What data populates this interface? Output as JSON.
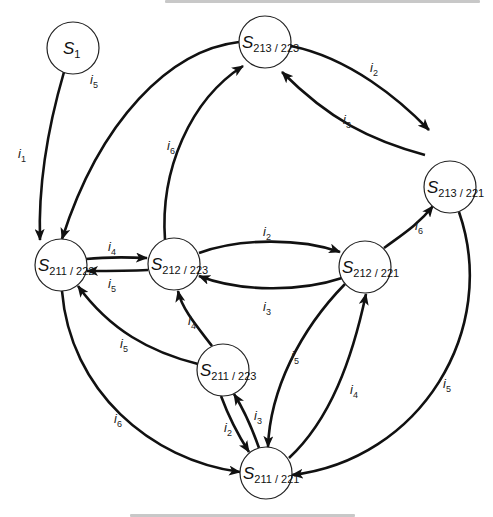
{
  "figure": {
    "type": "state-transition-diagram",
    "top_caption_fragment": "",
    "bottom_caption_fragment": ""
  },
  "nodes": [
    {
      "id": "S1",
      "symbol": "S",
      "sub": "1",
      "x": 73,
      "y": 48,
      "r": 26
    },
    {
      "id": "S213_223",
      "symbol": "S",
      "sub": "213 / 223",
      "x": 265,
      "y": 42,
      "r": 26
    },
    {
      "id": "S213_221",
      "symbol": "S",
      "sub": "213 / 221",
      "x": 450,
      "y": 187,
      "r": 26
    },
    {
      "id": "S211_222",
      "symbol": "S",
      "sub": "211 / 222",
      "x": 61,
      "y": 265,
      "r": 26
    },
    {
      "id": "S212_223",
      "symbol": "S",
      "sub": "212 / 223",
      "x": 174,
      "y": 264,
      "r": 26
    },
    {
      "id": "S212_221",
      "symbol": "S",
      "sub": "212 / 221",
      "x": 365,
      "y": 267,
      "r": 26
    },
    {
      "id": "S211_223",
      "symbol": "S",
      "sub": "211 / 223",
      "x": 223,
      "y": 370,
      "r": 26
    },
    {
      "id": "S211_221",
      "symbol": "S",
      "sub": "211 / 221",
      "x": 266,
      "y": 473,
      "r": 26
    }
  ],
  "edges": [
    {
      "from": "S1",
      "to": "S211_222",
      "symbol": "i",
      "sub": "1",
      "lx": 18,
      "ly": 158
    },
    {
      "from": "S213_223",
      "to": "S211_222",
      "symbol": "i",
      "sub": "5",
      "lx": 90,
      "ly": 84
    },
    {
      "from": "S213_223",
      "to": "S213_221",
      "symbol": "i",
      "sub": "2",
      "lx": 370,
      "ly": 72
    },
    {
      "from": "S213_221",
      "to": "S213_223",
      "symbol": "i",
      "sub": "3",
      "lx": 343,
      "ly": 124
    },
    {
      "from": "S212_223",
      "to": "S213_223",
      "symbol": "i",
      "sub": "6",
      "lx": 167,
      "ly": 150
    },
    {
      "from": "S211_222",
      "to": "S212_223",
      "symbol": "i",
      "sub": "4",
      "lx": 108,
      "ly": 251
    },
    {
      "from": "S212_223",
      "to": "S211_222",
      "symbol": "i",
      "sub": "5",
      "lx": 108,
      "ly": 288
    },
    {
      "from": "S212_223",
      "to": "S212_221",
      "symbol": "i",
      "sub": "2",
      "lx": 263,
      "ly": 236
    },
    {
      "from": "S212_221",
      "to": "S212_223",
      "symbol": "i",
      "sub": "3",
      "lx": 263,
      "ly": 311
    },
    {
      "from": "S212_221",
      "to": "S213_221",
      "symbol": "i",
      "sub": "6",
      "lx": 415,
      "ly": 230
    },
    {
      "from": "S211_223",
      "to": "S211_222",
      "symbol": "i",
      "sub": "5",
      "lx": 120,
      "ly": 348
    },
    {
      "from": "S211_223",
      "to": "S212_223",
      "symbol": "i",
      "sub": "4",
      "lx": 188,
      "ly": 325
    },
    {
      "from": "S212_221",
      "to": "S211_221",
      "symbol": "i",
      "sub": "5",
      "lx": 291,
      "ly": 360
    },
    {
      "from": "S211_221",
      "to": "S212_221",
      "symbol": "i",
      "sub": "4",
      "lx": 350,
      "ly": 394
    },
    {
      "from": "S211_223",
      "to": "S211_221",
      "symbol": "i",
      "sub": "2",
      "lx": 224,
      "ly": 432
    },
    {
      "from": "S211_221",
      "to": "S211_223",
      "symbol": "i",
      "sub": "3",
      "lx": 254,
      "ly": 420
    },
    {
      "from": "S211_222",
      "to": "S211_221",
      "symbol": "i",
      "sub": "6",
      "lx": 114,
      "ly": 423
    },
    {
      "from": "S213_221",
      "to": "S211_221",
      "symbol": "i",
      "sub": "5",
      "lx": 443,
      "ly": 388
    }
  ]
}
